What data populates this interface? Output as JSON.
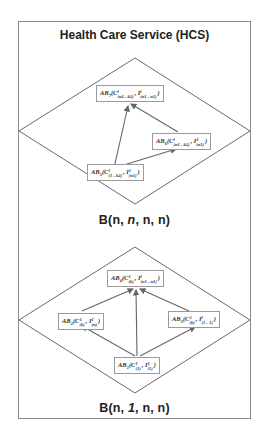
{
  "title": "Health Care Service (HCS)",
  "colors": {
    "frame": "#8a8a8a",
    "diamond": "#444444",
    "arrow": "#666666",
    "node_border": "#9a9a9a"
  },
  "top_block": {
    "label_prefix": "B(n, ",
    "label_italic": "n",
    "label_suffix": ", n, n)",
    "nodes": [
      {
        "id": "AB7",
        "name": "AB",
        "sub": "7",
        "c_sup": "l",
        "c_sub": "(n2 - k2)",
        "i_sup": "l",
        "i_sub": "(n1 - n1)"
      },
      {
        "id": "AB6",
        "name": "AB",
        "sub": "6",
        "c_sup": "l",
        "c_sub": "(n1 - k2)",
        "i_sup": "1",
        "i_sub": "(n1)"
      },
      {
        "id": "AB5",
        "name": "AB",
        "sub": "5",
        "c_sup": "l",
        "c_sub": "(1 - k2)",
        "i_sup": "1",
        "i_sub": "(n1)"
      }
    ],
    "edges": [
      [
        "AB5",
        "AB7"
      ],
      [
        "AB5",
        "AB6"
      ],
      [
        "AB6",
        "AB7"
      ]
    ]
  },
  "bottom_block": {
    "label_prefix": "B(n, ",
    "label_italic": "1",
    "label_suffix": ", n, n)",
    "nodes": [
      {
        "id": "AB4",
        "name": "AB",
        "sub": "4",
        "c_sup": "1",
        "c_sub": "(k)",
        "i_sup": "l",
        "i_sub": "(n1 - n1)"
      },
      {
        "id": "AB2",
        "name": "AB",
        "sub": "2",
        "c_sup": "1",
        "c_sub": "(k)",
        "i_sup": "1",
        "i_sub": "(n)"
      },
      {
        "id": "AB3",
        "name": "AB",
        "sub": "3",
        "c_sup": "1",
        "c_sub": "(k)",
        "i_sup": "l",
        "i_sub": "(1 - 1)"
      },
      {
        "id": "AB1",
        "name": "AB",
        "sub": "1",
        "c_sup": "1",
        "c_sub": "(1)",
        "i_sup": "1",
        "i_sub": "(1)"
      }
    ],
    "edges": [
      [
        "AB1",
        "AB2"
      ],
      [
        "AB1",
        "AB4"
      ],
      [
        "AB1",
        "AB3"
      ],
      [
        "AB2",
        "AB4"
      ],
      [
        "AB3",
        "AB4"
      ]
    ]
  }
}
